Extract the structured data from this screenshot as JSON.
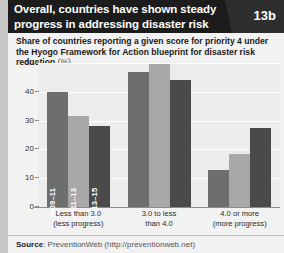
{
  "header": {
    "title": "Overall, countries have shown steady progress in addressing disaster risk",
    "badge": "13b"
  },
  "subtitle": {
    "text": "Share of countries reporting a given score for priority 4 under the Hyogo Framework for Action blueprint for disaster risk reduction",
    "unit": "(%)"
  },
  "footer": {
    "source_label": "Source",
    "source_text": ": PreventionWeb (http://preventionweb.net)"
  },
  "colors": {
    "series_2009_11": "#6e6e6e",
    "series_2011_13": "#a8a8a8",
    "series_2013_15": "#4a4a4a",
    "header_bg": "#1c1c1c",
    "badge_bg": "#2e2e2e",
    "panel_bg": "#f2f2f2",
    "plot_bg": "#ececec"
  },
  "chart_data": {
    "type": "bar",
    "title": "Overall, countries have shown steady progress in addressing disaster risk",
    "subtitle": "Share of countries reporting a given score for priority 4 under the Hyogo Framework for Action blueprint for disaster risk reduction (%)",
    "xlabel": "",
    "ylabel": "%",
    "ylim": [
      0,
      50
    ],
    "yticks": [
      0,
      10,
      20,
      30,
      40,
      50
    ],
    "grid": true,
    "legend_position": "in-bar",
    "categories": [
      "Less than 3.0\n(less progress)",
      "3.0 to less\nthan 4.0",
      "4.0 or more\n(more progress)"
    ],
    "category_lines": [
      [
        "Less than 3.0",
        "(less progress)"
      ],
      [
        "3.0 to less",
        "than 4.0"
      ],
      [
        "4.0 or more",
        "(more progress)"
      ]
    ],
    "series": [
      {
        "name": "2009–11",
        "color": "#6e6e6e",
        "values": [
          40.0,
          47.0,
          13.0
        ]
      },
      {
        "name": "2011–13",
        "color": "#a8a8a8",
        "values": [
          31.5,
          49.5,
          18.5
        ]
      },
      {
        "name": "2013–15",
        "color": "#4a4a4a",
        "values": [
          28.0,
          44.0,
          27.5
        ]
      }
    ]
  }
}
